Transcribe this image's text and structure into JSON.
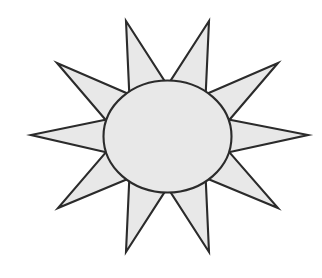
{
  "artwork": {
    "title": "Sun with ten pointed rays",
    "subject": "sun-icon",
    "style": "line-art clipart",
    "background_color": "#ffffff",
    "fill_color": "#e8e8e8",
    "stroke_color": "#2b2b2b",
    "stroke_width": 2.1,
    "canvas": {
      "width": 322,
      "height": 278
    },
    "center_body": {
      "name": "sun-core",
      "type": "ellipse",
      "cx": 167.5,
      "cy": 136.5,
      "rx": 64,
      "ry": 56
    },
    "rays": {
      "name": "sun-rays",
      "count": 10,
      "type": "triangular-spikes",
      "tip_radius_long": 148,
      "tip_radius_short": 142,
      "base_half_angle_deg": 17,
      "base_radius": 58,
      "tips": [
        {
          "label": "ray-n-left",
          "x": 126,
          "y": 21
        },
        {
          "label": "ray-n-right",
          "x": 209,
          "y": 21
        },
        {
          "label": "ray-ne",
          "x": 278,
          "y": 63
        },
        {
          "label": "ray-e",
          "x": 308,
          "y": 135
        },
        {
          "label": "ray-se",
          "x": 278,
          "y": 208
        },
        {
          "label": "ray-s-right",
          "x": 209,
          "y": 252
        },
        {
          "label": "ray-s-left",
          "x": 126,
          "y": 252
        },
        {
          "label": "ray-sw",
          "x": 58,
          "y": 208
        },
        {
          "label": "ray-w",
          "x": 31,
          "y": 135
        },
        {
          "label": "ray-nw",
          "x": 57,
          "y": 63
        }
      ]
    }
  }
}
